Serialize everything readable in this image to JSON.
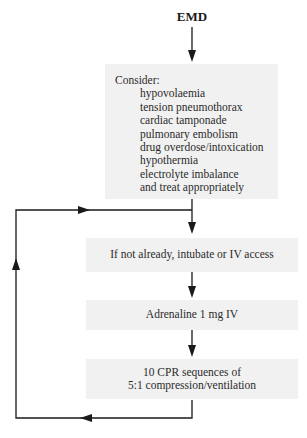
{
  "title": "EMD",
  "consider_box": {
    "heading": "Consider:",
    "items": [
      "hypovolaemia",
      "tension pneumothorax",
      "cardiac tamponade",
      "pulmonary embolism",
      "drug overdose/intoxication",
      "hypothermia",
      "electrolyte imbalance",
      "and treat appropriately"
    ]
  },
  "steps": [
    {
      "label": "If not already, intubate or IV access"
    },
    {
      "label": "Adrenaline 1 mg IV"
    },
    {
      "label_line1": "10 CPR sequences of",
      "label_line2": "5:1 compression/ventilation"
    }
  ],
  "colors": {
    "box_fill": "#f1f1f1",
    "line": "#1a1a1a"
  }
}
